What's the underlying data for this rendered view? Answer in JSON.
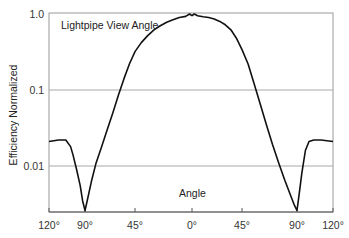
{
  "chart_data": {
    "type": "line",
    "title": "Lightpipe View Angle",
    "xlabel": "Angle",
    "ylabel": "Efficiency Normalized",
    "yscale": "log",
    "ylim": [
      0.0025,
      1.0
    ],
    "xlim": [
      -120,
      120
    ],
    "grid": {
      "horizontal": true,
      "vertical": false
    },
    "x_ticks": [
      {
        "value": -120,
        "label": "120°"
      },
      {
        "value": -90,
        "label": "90°"
      },
      {
        "value": -45,
        "label": "45°"
      },
      {
        "value": 0,
        "label": "0°"
      },
      {
        "value": 45,
        "label": "45°"
      },
      {
        "value": 90,
        "label": "90°"
      },
      {
        "value": 120,
        "label": "120°"
      }
    ],
    "y_ticks": [
      {
        "value": 1.0,
        "label": "1.0"
      },
      {
        "value": 0.1,
        "label": "0.1"
      },
      {
        "value": 0.01,
        "label": "0.01"
      }
    ],
    "series": [
      {
        "name": "Lightpipe View Angle",
        "color": "#111111",
        "x": [
          -120,
          -112,
          -106,
          -102,
          -100,
          -97,
          -94,
          -92,
          -90,
          -88,
          -84,
          -80,
          -75,
          -70,
          -65,
          -60,
          -55,
          -50,
          -45,
          -40,
          -35,
          -30,
          -25,
          -20,
          -15,
          -10,
          -5,
          -2,
          0,
          2,
          5,
          10,
          15,
          20,
          25,
          30,
          35,
          40,
          45,
          50,
          55,
          60,
          65,
          70,
          75,
          80,
          85,
          88,
          90,
          92,
          94,
          97,
          100,
          104,
          110,
          120
        ],
        "values": [
          0.021,
          0.022,
          0.022,
          0.018,
          0.014,
          0.009,
          0.0055,
          0.0035,
          0.0026,
          0.0035,
          0.0065,
          0.011,
          0.018,
          0.03,
          0.05,
          0.085,
          0.14,
          0.22,
          0.32,
          0.42,
          0.52,
          0.62,
          0.7,
          0.78,
          0.84,
          0.9,
          0.93,
          1.0,
          0.95,
          1.0,
          0.95,
          0.92,
          0.9,
          0.86,
          0.8,
          0.72,
          0.62,
          0.48,
          0.34,
          0.22,
          0.12,
          0.065,
          0.035,
          0.019,
          0.011,
          0.0065,
          0.004,
          0.003,
          0.0026,
          0.0045,
          0.008,
          0.016,
          0.021,
          0.022,
          0.022,
          0.021
        ]
      }
    ],
    "annotations": [
      {
        "text": "Lightpipe View Angle",
        "position": "top-left inside plot"
      },
      {
        "text": "Angle",
        "position": "bottom-center inside plot"
      }
    ]
  },
  "labels": {
    "title": "Lightpipe View Angle",
    "xlabel": "Angle",
    "ylabel": "Efficiency Normalized"
  }
}
